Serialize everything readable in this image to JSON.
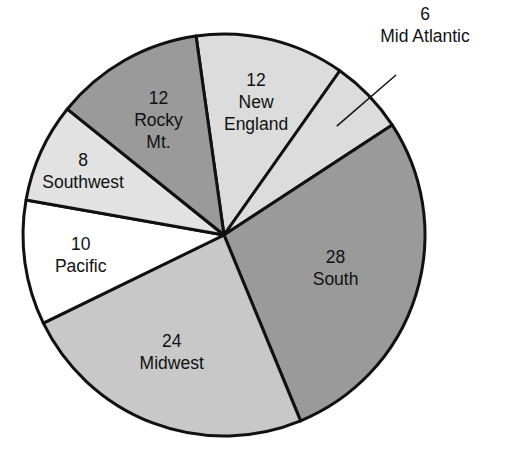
{
  "chart_data": {
    "type": "pie",
    "title": "",
    "start_angle_deg": -8,
    "direction": "clockwise",
    "slices": [
      {
        "label": "New England",
        "value": 12,
        "value_label": "12",
        "name_lines": [
          "New",
          "England"
        ],
        "color": "#dcdcdc"
      },
      {
        "label": "Mid Atlantic",
        "value": 6,
        "value_label": "6",
        "name_lines": [
          "Mid Atlantic"
        ],
        "color": "#dcdcdc",
        "label_outside": true
      },
      {
        "label": "South",
        "value": 28,
        "value_label": "28",
        "name_lines": [
          "South"
        ],
        "color": "#9a9a9a"
      },
      {
        "label": "Midwest",
        "value": 24,
        "value_label": "24",
        "name_lines": [
          "Midwest"
        ],
        "color": "#c8c8c8"
      },
      {
        "label": "Pacific",
        "value": 10,
        "value_label": "10",
        "name_lines": [
          "Pacific"
        ],
        "color": "#ffffff"
      },
      {
        "label": "Southwest",
        "value": 8,
        "value_label": "8",
        "name_lines": [
          "Southwest"
        ],
        "color": "#e2e2e2"
      },
      {
        "label": "Rocky Mt.",
        "value": 12,
        "value_label": "12",
        "name_lines": [
          "Rocky",
          "Mt."
        ],
        "color": "#9a9a9a"
      }
    ]
  }
}
